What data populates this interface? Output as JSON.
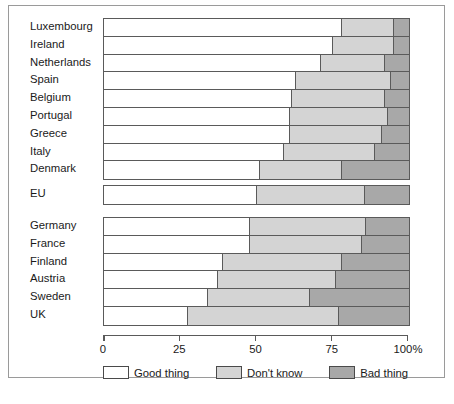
{
  "chart_data": {
    "type": "bar",
    "orientation": "horizontal",
    "stacked": true,
    "title": "",
    "xlabel": "",
    "ylabel": "",
    "xlim": [
      0,
      100
    ],
    "grid": false,
    "axis_ticks": [
      "0",
      "25",
      "50",
      "75",
      "100%"
    ],
    "axis_tick_values": [
      0,
      25,
      50,
      75,
      100
    ],
    "legend_position": "bottom",
    "legend": [
      {
        "label": "Good thing",
        "color": "#ffffff"
      },
      {
        "label": "Don't know",
        "color": "#d4d4d4"
      },
      {
        "label": "Bad thing",
        "color": "#a8a8a8"
      }
    ],
    "series": [
      {
        "name": "Good thing",
        "values": [
          78,
          75,
          71,
          63,
          61.5,
          61,
          61,
          59,
          51,
          50,
          48,
          48,
          39,
          37.5,
          34,
          27.5
        ]
      },
      {
        "name": "Don't know",
        "values": [
          17,
          20,
          21,
          31,
          30.5,
          32,
          30,
          30,
          27,
          35.5,
          38,
          36.5,
          39,
          38.5,
          33.5,
          49.5
        ]
      },
      {
        "name": "Bad thing",
        "values": [
          5,
          5,
          8,
          6,
          8,
          7,
          9,
          11,
          22,
          14.5,
          14,
          15.5,
          22,
          24,
          32.5,
          23
        ]
      }
    ],
    "categories": [
      "Luxembourg",
      "Ireland",
      "Netherlands",
      "Spain",
      "Belgium",
      "Portugal",
      "Greece",
      "Italy",
      "Denmark",
      "EU",
      "Germany",
      "France",
      "Finland",
      "Austria",
      "Sweden",
      "UK"
    ],
    "groups": [
      {
        "name": "above-eu-average",
        "rows": [
          {
            "label": "Luxembourg",
            "good": 78,
            "dont_know": 17,
            "bad": 5
          },
          {
            "label": "Ireland",
            "good": 75,
            "dont_know": 20,
            "bad": 5
          },
          {
            "label": "Netherlands",
            "good": 71,
            "dont_know": 21,
            "bad": 8
          },
          {
            "label": "Spain",
            "good": 63,
            "dont_know": 31,
            "bad": 6
          },
          {
            "label": "Belgium",
            "good": 61.5,
            "dont_know": 30.5,
            "bad": 8
          },
          {
            "label": "Portugal",
            "good": 61,
            "dont_know": 32,
            "bad": 7
          },
          {
            "label": "Greece",
            "good": 61,
            "dont_know": 30,
            "bad": 9
          },
          {
            "label": "Italy",
            "good": 59,
            "dont_know": 30,
            "bad": 11
          },
          {
            "label": "Denmark",
            "good": 51,
            "dont_know": 27,
            "bad": 22
          }
        ]
      },
      {
        "name": "eu-average",
        "rows": [
          {
            "label": "EU",
            "good": 50,
            "dont_know": 35.5,
            "bad": 14.5
          }
        ]
      },
      {
        "name": "below-eu-average",
        "rows": [
          {
            "label": "Germany",
            "good": 48,
            "dont_know": 38,
            "bad": 14
          },
          {
            "label": "France",
            "good": 48,
            "dont_know": 36.5,
            "bad": 15.5
          },
          {
            "label": "Finland",
            "good": 39,
            "dont_know": 39,
            "bad": 22
          },
          {
            "label": "Austria",
            "good": 37.5,
            "dont_know": 38.5,
            "bad": 24
          },
          {
            "label": "Sweden",
            "good": 34,
            "dont_know": 33.5,
            "bad": 32.5
          },
          {
            "label": "UK",
            "good": 27.5,
            "dont_know": 49.5,
            "bad": 23
          }
        ]
      }
    ]
  }
}
